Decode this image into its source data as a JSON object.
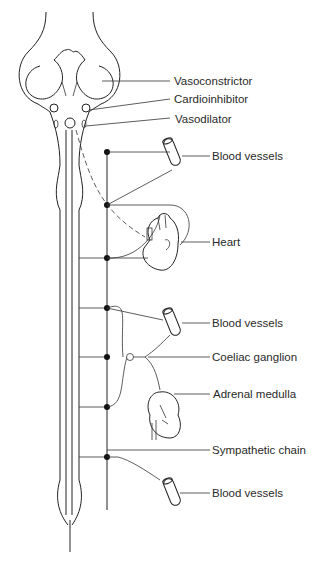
{
  "diagram": {
    "labels": {
      "vasoconstrictor": "Vasoconstrictor",
      "cardioinhibitor": "Cardioinhibitor",
      "vasodilator": "Vasodilator",
      "blood_vessels_1": "Blood vessels",
      "heart": "Heart",
      "blood_vessels_2": "Blood vessels",
      "coeliac_ganglion": "Coeliac ganglion",
      "adrenal_medulla": "Adrenal medulla",
      "sympathetic_chain": "Sympathetic chain",
      "blood_vessels_3": "Blood vessels"
    }
  }
}
